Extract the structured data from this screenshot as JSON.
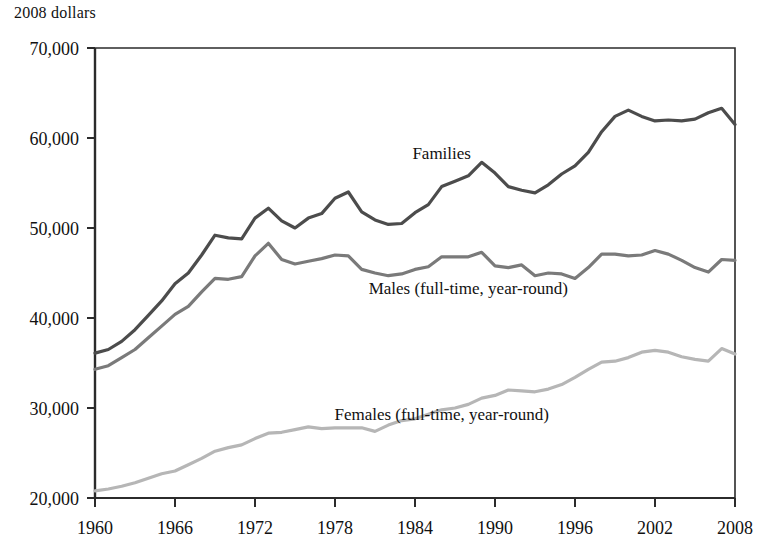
{
  "unit_label": "2008 dollars",
  "colors": {
    "axis": "#2b2b2b",
    "text": "#111111",
    "families": "#4c4c4c",
    "males": "#7a7a7a",
    "females": "#b6b6b6",
    "background": "#ffffff"
  },
  "labels": {
    "families": "Families",
    "males": "Males (full-time, year-round)",
    "females": "Females (full-time, year-round)"
  },
  "chart_data": {
    "type": "line",
    "title": "",
    "subtitle": "",
    "xlabel": "",
    "ylabel": "2008 dollars",
    "xlim": [
      1960,
      2008
    ],
    "ylim": [
      20000,
      70000
    ],
    "grid": false,
    "legend": "inline-annotations",
    "xticks": [
      1960,
      1966,
      1972,
      1978,
      1984,
      1990,
      1996,
      2002,
      2008
    ],
    "xtick_labels": [
      "1960",
      "1966",
      "1972",
      "1978",
      "1984",
      "1990",
      "1996",
      "2002",
      "2008"
    ],
    "yticks": [
      20000,
      30000,
      40000,
      50000,
      60000,
      70000
    ],
    "ytick_labels": [
      "20,000",
      "30,000",
      "40,000",
      "50,000",
      "60,000",
      "70,000"
    ],
    "x": [
      1960,
      1961,
      1962,
      1963,
      1964,
      1965,
      1966,
      1967,
      1968,
      1969,
      1970,
      1971,
      1972,
      1973,
      1974,
      1975,
      1976,
      1977,
      1978,
      1979,
      1980,
      1981,
      1982,
      1983,
      1984,
      1985,
      1986,
      1987,
      1988,
      1989,
      1990,
      1991,
      1992,
      1993,
      1994,
      1995,
      1996,
      1997,
      1998,
      1999,
      2000,
      2001,
      2002,
      2003,
      2004,
      2005,
      2006,
      2007,
      2008
    ],
    "series": [
      {
        "name": "Families",
        "color": "#4c4c4c",
        "annotation": "Families",
        "annotation_x": 1986,
        "annotation_y": 57700,
        "values": [
          36100,
          36500,
          37400,
          38700,
          40300,
          41900,
          43800,
          45000,
          47000,
          49200,
          48900,
          48800,
          51100,
          52200,
          50800,
          50000,
          51100,
          51600,
          53300,
          54000,
          51800,
          50900,
          50400,
          50500,
          51700,
          52600,
          54600,
          55200,
          55800,
          57300,
          56100,
          54600,
          54200,
          53900,
          54800,
          56000,
          56900,
          58400,
          60700,
          62400,
          63100,
          62400,
          61900,
          62000,
          61900,
          62100,
          62800,
          63300,
          61500
        ]
      },
      {
        "name": "Males (full-time, year-round)",
        "color": "#7a7a7a",
        "annotation": "Males (full-time, year-round)",
        "annotation_x": 1988,
        "annotation_y": 42700,
        "values": [
          34300,
          34700,
          35600,
          36500,
          37800,
          39100,
          40400,
          41300,
          42900,
          44400,
          44300,
          44600,
          46900,
          48300,
          46500,
          46000,
          46300,
          46600,
          47000,
          46900,
          45400,
          45000,
          44700,
          44900,
          45400,
          45700,
          46800,
          46800,
          46800,
          47300,
          45800,
          45600,
          45900,
          44700,
          45000,
          44900,
          44400,
          45600,
          47100,
          47100,
          46900,
          47000,
          47500,
          47100,
          46400,
          45600,
          45100,
          46500,
          46400
        ]
      },
      {
        "name": "Females (full-time, year-round)",
        "color": "#b6b6b6",
        "annotation": "Females (full-time, year-round)",
        "annotation_x": 1986,
        "annotation_y": 28700,
        "values": [
          20800,
          21000,
          21300,
          21700,
          22200,
          22700,
          23000,
          23700,
          24400,
          25200,
          25600,
          25900,
          26600,
          27200,
          27300,
          27600,
          27900,
          27700,
          27800,
          27800,
          27800,
          27400,
          28100,
          28600,
          28800,
          29300,
          29800,
          30000,
          30400,
          31100,
          31400,
          32000,
          31900,
          31800,
          32100,
          32600,
          33400,
          34300,
          35100,
          35200,
          35600,
          36200,
          36400,
          36200,
          35700,
          35400,
          35200,
          36600,
          36000
        ]
      }
    ]
  }
}
